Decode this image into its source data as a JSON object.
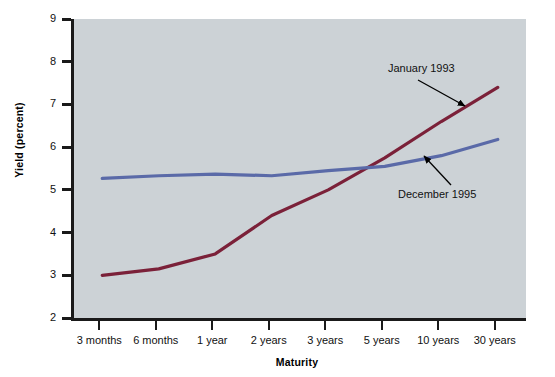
{
  "chart_data": {
    "type": "line",
    "title": "",
    "xlabel": "Maturity",
    "ylabel": "Yield (percent)",
    "categories": [
      "3 months",
      "6 months",
      "1 year",
      "2 years",
      "3 years",
      "5 years",
      "10 years",
      "30 years"
    ],
    "ylim": [
      2,
      9
    ],
    "yticks": [
      2,
      3,
      4,
      5,
      6,
      7,
      8,
      9
    ],
    "grid": false,
    "legend_position": "annotations-inline",
    "series": [
      {
        "name": "January 1993",
        "color": "#7b2139",
        "values": [
          3.0,
          3.15,
          3.5,
          4.4,
          5.0,
          5.75,
          6.6,
          7.4
        ]
      },
      {
        "name": "December 1995",
        "color": "#5a6aa8",
        "values": [
          5.27,
          5.33,
          5.37,
          5.33,
          5.45,
          5.55,
          5.8,
          6.18
        ]
      }
    ],
    "annotations": [
      {
        "text": "January 1993",
        "target_series": "January 1993",
        "arrow": "down-right"
      },
      {
        "text": "December 1995",
        "target_series": "December 1995",
        "arrow": "up-left"
      }
    ],
    "plot_background": "#ccd2d6",
    "axis_color": "#1a1a1a"
  },
  "axis": {
    "y_tick_labels": [
      "9",
      "8",
      "7",
      "6",
      "5",
      "4",
      "3",
      "2"
    ],
    "y_title": "Yield (percent)",
    "x_title": "Maturity",
    "x_tick_labels": [
      "3 months",
      "6 months",
      "1 year",
      "2 years",
      "3 years",
      "5 years",
      "10 years",
      "30 years"
    ]
  },
  "annotations": {
    "january": "January 1993",
    "december": "December 1995"
  }
}
